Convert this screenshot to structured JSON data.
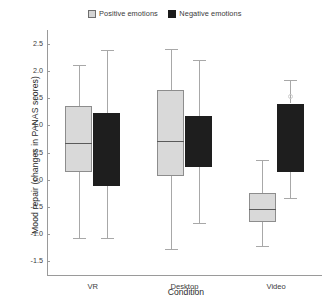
{
  "chart_data": {
    "type": "box",
    "title": "",
    "xlabel": "Condition",
    "ylabel": "Mood repair (changes in PANAS scores)",
    "ylim": [
      -1.75,
      2.75
    ],
    "yticks": [
      2.5,
      2.0,
      1.5,
      1.0,
      0.5,
      0.0,
      -0.5,
      -1.0,
      -1.5
    ],
    "ytick_labels": [
      "2.5",
      "2.0",
      "1.5",
      "1.0",
      "0.5",
      "0.0",
      "-0.5",
      "-1.0",
      "-1.5"
    ],
    "categories": [
      "VR",
      "Desktop",
      "Video"
    ],
    "grid": false,
    "legend_position": "top-center",
    "series": [
      {
        "name": "Positive emotions",
        "color": "#d9d9d9",
        "boxes": [
          {
            "category": "VR",
            "whisker_low": -1.07,
            "q1": 0.15,
            "median": 0.67,
            "q3": 1.35,
            "whisker_high": 2.1,
            "outliers": []
          },
          {
            "category": "Desktop",
            "whisker_low": -1.28,
            "q1": 0.07,
            "median": 0.71,
            "q3": 1.64,
            "whisker_high": 2.41,
            "outliers": []
          },
          {
            "category": "Video",
            "whisker_low": -1.22,
            "q1": -0.78,
            "median": -0.53,
            "q3": -0.24,
            "whisker_high": 0.36,
            "outliers": []
          }
        ]
      },
      {
        "name": "Negative emotions",
        "color": "#1e1e1e",
        "boxes": [
          {
            "category": "VR",
            "whisker_low": -1.07,
            "q1": -0.12,
            "median": null,
            "q3": 1.22,
            "whisker_high": 2.38,
            "outliers": []
          },
          {
            "category": "Desktop",
            "whisker_low": -0.79,
            "q1": 0.24,
            "median": null,
            "q3": 1.17,
            "whisker_high": 2.2,
            "outliers": []
          },
          {
            "category": "Video",
            "whisker_low": -0.33,
            "q1": 0.15,
            "median": null,
            "q3": 1.4,
            "whisker_high": 1.83,
            "outliers": [
              1.53
            ]
          }
        ]
      }
    ]
  },
  "legend": {
    "positive_label": "Positive emotions",
    "negative_label": "Negative emotions"
  }
}
